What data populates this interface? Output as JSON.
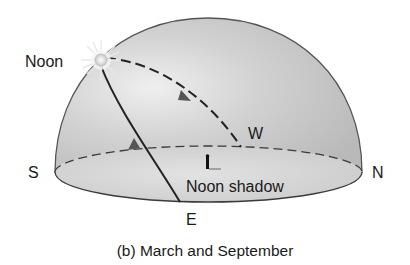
{
  "figure": {
    "caption": "(b) March and September",
    "labels": {
      "noon": "Noon",
      "west": "W",
      "south": "S",
      "north": "N",
      "east": "E",
      "noon_shadow": "Noon shadow"
    },
    "icons": {
      "sun": "sun-icon",
      "person": "person-icon"
    },
    "colors": {
      "dome_fill": "#c4c4c4",
      "dome_highlight": "#f0f0f0",
      "outline": "#4a4a4a",
      "path": "#2a2a2a",
      "sun_glow": "#f4f4f4"
    }
  }
}
